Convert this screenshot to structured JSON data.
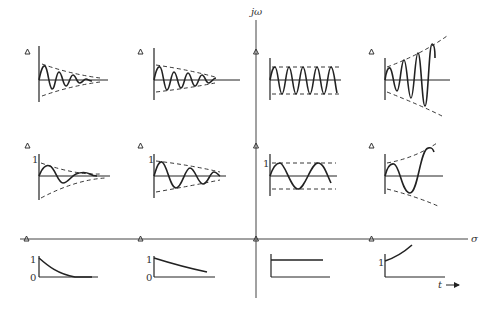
{
  "axes": {
    "vertical_label": "jω",
    "horizontal_label": "σ",
    "time_label": "t"
  },
  "pole_marker": "triangle",
  "rows": [
    {
      "name": "complex-poles-high-frequency",
      "cells": [
        {
          "column": "far-left-half-plane",
          "response": "fast-decaying oscillation"
        },
        {
          "column": "left-half-plane",
          "response": "slowly decaying oscillation"
        },
        {
          "column": "imaginary-axis",
          "response": "sustained oscillation"
        },
        {
          "column": "right-half-plane",
          "response": "growing oscillation"
        }
      ]
    },
    {
      "name": "complex-poles-low-frequency",
      "cells": [
        {
          "column": "far-left-half-plane",
          "response": "fast-decaying oscillation",
          "y_tick": "1"
        },
        {
          "column": "left-half-plane",
          "response": "slowly decaying oscillation",
          "y_tick": "1"
        },
        {
          "column": "imaginary-axis",
          "response": "sustained oscillation",
          "y_tick": "1"
        },
        {
          "column": "right-half-plane",
          "response": "growing oscillation"
        }
      ]
    },
    {
      "name": "real-poles",
      "cells": [
        {
          "column": "far-left-half-plane",
          "response": "fast exponential decay",
          "y_ticks": [
            "1",
            "0"
          ]
        },
        {
          "column": "left-half-plane",
          "response": "slow exponential decay",
          "y_ticks": [
            "1",
            "0"
          ]
        },
        {
          "column": "imaginary-axis",
          "response": "constant step"
        },
        {
          "column": "right-half-plane",
          "response": "exponential growth",
          "y_tick": "1"
        }
      ]
    }
  ],
  "tick_labels": {
    "one": "1",
    "zero": "0"
  }
}
